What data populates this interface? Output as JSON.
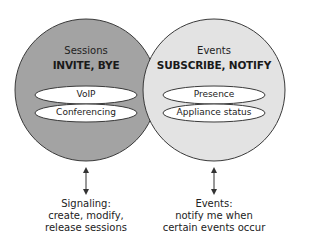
{
  "colors": {
    "sessions_fill": "#a3a3a3",
    "events_fill": "#e3e3e3",
    "stroke": "#3a3a3a",
    "pill_fill": "#ffffff"
  },
  "sessions": {
    "title": "Sessions",
    "methods": "INVITE, BYE",
    "items": [
      "VoIP",
      "Conferencing"
    ],
    "caption": [
      "Signaling:",
      "create, modify,",
      "release sessions"
    ]
  },
  "events": {
    "title": "Events",
    "methods": "SUBSCRIBE, NOTIFY",
    "items": [
      "Presence",
      "Appliance status"
    ],
    "caption": [
      "Events:",
      "notify me when",
      "certain events occur"
    ]
  }
}
